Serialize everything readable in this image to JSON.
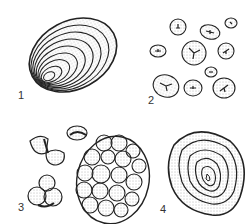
{
  "figure": {
    "panels": [
      {
        "id": 1,
        "label": "1",
        "description": "single large eccentric oval grain with concentric lamellae"
      },
      {
        "id": 2,
        "label": "2",
        "description": "scattered rounded grains of varying size with stellate hilum cracks"
      },
      {
        "id": 3,
        "label": "3",
        "description": "compound grains: split halves, small cluster, and large polyhedral aggregate"
      },
      {
        "id": 4,
        "label": "4",
        "description": "single rounded-triangular grain with concentric rings around central hilum"
      }
    ],
    "colors": {
      "ink": "#222222",
      "stipple": "#777777",
      "background": "#ffffff"
    }
  }
}
